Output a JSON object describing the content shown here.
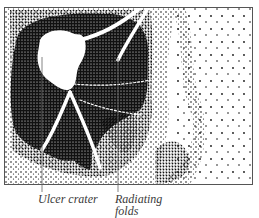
{
  "figure": {
    "type": "stippled anatomical illustration",
    "colors": {
      "ink": "#111111",
      "frame": "#555555",
      "label_text": "#3a3a3a",
      "background": "#ffffff"
    }
  },
  "labels": [
    {
      "id": "ulcer-crater",
      "text": "Ulcer crater"
    },
    {
      "id": "radiating-folds",
      "line1": "Radiating",
      "line2": "folds"
    }
  ]
}
